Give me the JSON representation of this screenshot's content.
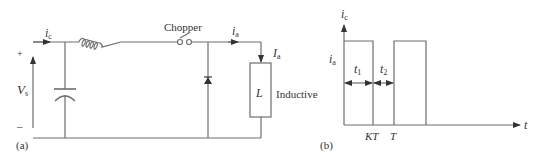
{
  "circuit": {
    "part_label": "(a)",
    "source_current": "i",
    "source_current_sub": "c",
    "plus": "+",
    "minus": "–",
    "source_voltage": "V",
    "source_voltage_sub": "s",
    "switch_label": "Chopper",
    "load_current": "i",
    "load_current_sub": "a",
    "load_current_avg": "I",
    "load_current_avg_sub": "a",
    "load_symbol": "L",
    "load_type": "Inductive"
  },
  "waveform": {
    "part_label": "(b)",
    "y_axis": "i",
    "y_axis_sub": "c",
    "level": "i",
    "level_sub": "a",
    "t1": "t",
    "t1_sub": "1",
    "t2": "t",
    "t2_sub": "2",
    "x_tick_1": "KT",
    "x_tick_2": "T",
    "x_axis": "t"
  },
  "colors": {
    "line": "#6e6e6e",
    "text": "#333333"
  }
}
